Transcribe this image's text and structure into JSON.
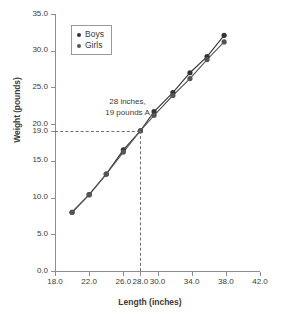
{
  "chart_data": {
    "type": "line",
    "title": "",
    "xlabel": "Length (inches)",
    "ylabel": "Weight (pounds)",
    "xlim": [
      18.0,
      42.0
    ],
    "ylim": [
      0.0,
      35.0
    ],
    "grid": false,
    "legend_position": "top-left",
    "xticks": [
      "18.0",
      "22.0",
      "26.0",
      "28.0",
      "30.0",
      "34.0",
      "38.0",
      "42.0"
    ],
    "xtick_values": [
      18.0,
      22.0,
      26.0,
      28.0,
      30.0,
      34.0,
      38.0,
      42.0
    ],
    "yticks": [
      "0.0",
      "5.0",
      "10.0",
      "15.0",
      "19.0",
      "20.0",
      "25.0",
      "30.0",
      "35.0"
    ],
    "ytick_values": [
      0.0,
      5.0,
      10.0,
      15.0,
      19.0,
      20.0,
      25.0,
      30.0,
      35.0
    ],
    "series": [
      {
        "name": "Boys",
        "color": "#333333",
        "x": [
          20.0,
          22.0,
          24.0,
          26.0,
          28.0,
          29.6,
          31.8,
          33.8,
          35.8,
          37.8
        ],
        "values": [
          8.0,
          10.4,
          13.2,
          16.5,
          19.1,
          21.7,
          24.3,
          27.0,
          29.2,
          32.1
        ]
      },
      {
        "name": "Girls",
        "color": "#555555",
        "x": [
          20.0,
          22.0,
          24.0,
          26.0,
          28.0,
          29.6,
          31.8,
          33.8,
          35.8,
          37.8
        ],
        "values": [
          8.0,
          10.4,
          13.2,
          16.2,
          19.1,
          21.2,
          23.9,
          26.2,
          28.8,
          31.2
        ]
      }
    ],
    "annotations": [
      {
        "name": "point-a",
        "line1": "28 inches,",
        "line2": "19 pounds A",
        "x": 28.0,
        "y": 19.0
      }
    ]
  },
  "legend": {
    "items": [
      {
        "label": "Boys",
        "color": "#333333"
      },
      {
        "label": "Girls",
        "color": "#555555"
      }
    ]
  }
}
